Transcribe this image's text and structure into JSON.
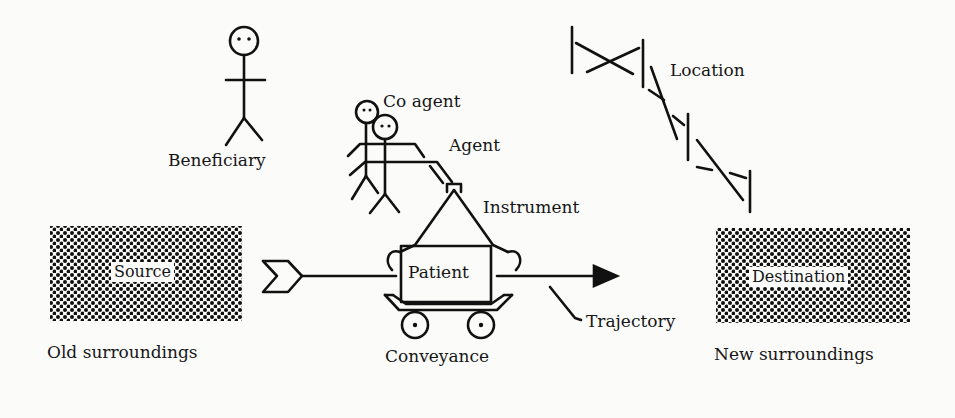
{
  "diagram": {
    "title": "",
    "roles": {
      "beneficiary": "Beneficiary",
      "co_agent": "Co agent",
      "agent": "Agent",
      "instrument": "Instrument",
      "location": "Location",
      "source": "Source",
      "patient": "Patient",
      "destination": "Destination",
      "trajectory": "Trajectory",
      "conveyance": "Conveyance",
      "old_surroundings": "Old surroundings",
      "new_surroundings": "New surroundings"
    },
    "colors": {
      "ink": "#111111",
      "background": "#fbfbfa"
    }
  }
}
